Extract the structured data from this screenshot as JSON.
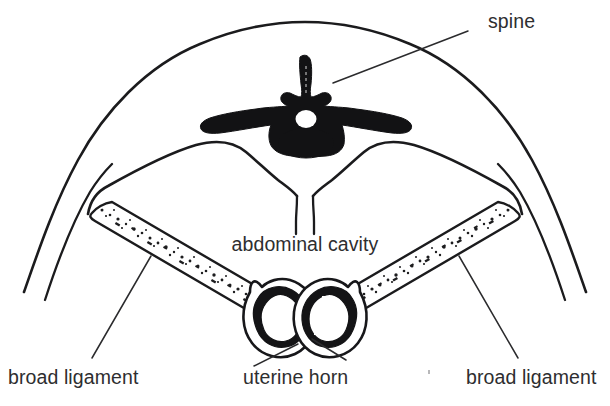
{
  "figure": {
    "title": "Transverse section of the abdomen showing spine, abdominal cavity, broad ligaments and uterine horns",
    "background_color": "#ffffff",
    "ink_color": "#1b1b1d",
    "text_color": "#2e2e30"
  },
  "labels": {
    "spine": "spine",
    "abdominal_cavity": "abdominal cavity",
    "broad_ligament_left": "broad ligament",
    "uterine_horn": "uterine horn",
    "broad_ligament_right": "broad ligament"
  },
  "structures": {
    "body_wall": "body-wall-outline",
    "peritoneal_lining": "peritoneal-cavity-outline",
    "vertebra": "vertebra-cross-section",
    "spinal_canal": "spinal-canal",
    "midline_mesentery": "midline-mesentery",
    "left_broad_ligament": "left-broad-ligament-band",
    "right_broad_ligament": "right-broad-ligament-band",
    "left_uterine_horn": "left-uterine-horn",
    "right_uterine_horn": "right-uterine-horn"
  }
}
